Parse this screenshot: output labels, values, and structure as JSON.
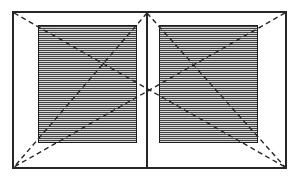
{
  "diagram": {
    "canvas": {
      "width": 299,
      "height": 181,
      "background": "#ffffff"
    },
    "colors": {
      "line": "#262626",
      "panel_border": "#1c1c1c",
      "hatch_line": "#454545",
      "hatch_gap": "#d6d6d6"
    },
    "outer_frame": {
      "x": 12,
      "y": 11,
      "width": 275,
      "height": 158,
      "border_width": 2
    },
    "center_mullion": {
      "x": 146,
      "y": 11,
      "width": 2,
      "height": 158
    },
    "glazing_panels": [
      {
        "id": "left-sash",
        "x": 38,
        "y": 25,
        "width": 99,
        "height": 118,
        "border_width": 1.5
      },
      {
        "id": "right-sash",
        "x": 159,
        "y": 25,
        "width": 99,
        "height": 118,
        "border_width": 1.5
      }
    ],
    "hatch": {
      "direction": "horizontal",
      "line_px": 1,
      "spacing_px": 2
    },
    "dashed_lines": [
      {
        "x1": 14,
        "y1": 13,
        "x2": 285,
        "y2": 167
      },
      {
        "x1": 285,
        "y1": 13,
        "x2": 14,
        "y2": 167
      },
      {
        "x1": 147,
        "y1": 13,
        "x2": 14,
        "y2": 167
      },
      {
        "x1": 147,
        "y1": 13,
        "x2": 285,
        "y2": 167
      }
    ],
    "dash_style": {
      "dasharray": "5 3.5",
      "stroke_width": 1.4
    }
  }
}
